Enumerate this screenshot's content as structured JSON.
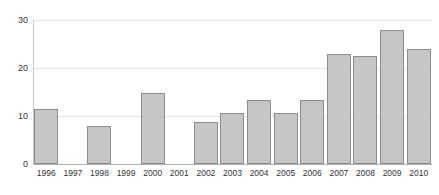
{
  "chart_data": {
    "type": "bar",
    "title": "",
    "subtitle": "",
    "xlabel": "",
    "ylabel": "",
    "categories": [
      "1996",
      "1997",
      "1998",
      "1999",
      "2000",
      "2001",
      "2002",
      "2003",
      "2004",
      "2005",
      "2006",
      "2007",
      "2008",
      "2009",
      "2010"
    ],
    "values": [
      11.5,
      0,
      8,
      0,
      14.8,
      0,
      8.8,
      10.7,
      13.3,
      10.6,
      13.3,
      23,
      22.5,
      28,
      24
    ],
    "ylim": [
      0,
      30
    ],
    "yticks": [
      0,
      10,
      20,
      30
    ],
    "ytick_labels": [
      "0",
      "10",
      "20",
      "30"
    ],
    "grid": true,
    "legend": "none",
    "bar_fill_color": "#c6c6c6",
    "bar_border_color": "#8c8c8c",
    "gridline_color": "#e3e3e3",
    "axis_color": "#b0b0b0",
    "text_color": "#333333",
    "missing_years": [
      "1997",
      "1999",
      "2001"
    ]
  }
}
